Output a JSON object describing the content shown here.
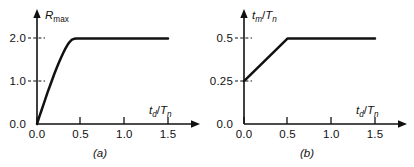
{
  "figure": {
    "background_color": "#ffffff",
    "line_color": "#111111",
    "panels": [
      {
        "key": "a",
        "caption": "(a)",
        "ylabel_main": "R",
        "ylabel_sub": "max",
        "xlabel_main_1": "t",
        "xlabel_sub_1": "d",
        "xlabel_slash": "/",
        "xlabel_main_2": "T",
        "xlabel_sub_2": "n",
        "xticks": [
          "0.0",
          "0.5",
          "1.0",
          "1.5"
        ],
        "yticks": [
          "0.0",
          "1.0",
          "2.0"
        ]
      },
      {
        "key": "b",
        "caption": "(b)",
        "ylabel_main": "t",
        "ylabel_sub": "m",
        "ylabel_slash": "/",
        "ylabel_main_2": "T",
        "ylabel_sub_2": "n",
        "xlabel_main_1": "t",
        "xlabel_sub_1": "d",
        "xlabel_slash": "/",
        "xlabel_main_2": "T",
        "xlabel_sub_2": "n",
        "xticks": [
          "0.0",
          "0.5",
          "1.0",
          "1.5"
        ],
        "yticks": [
          "0.0",
          "0.25",
          "0.5"
        ]
      }
    ]
  },
  "chart_data": [
    {
      "type": "line",
      "title": "(a)",
      "xlabel": "td/Tn",
      "ylabel": "Rmax",
      "xlim": [
        0.0,
        1.6
      ],
      "ylim": [
        0.0,
        2.2
      ],
      "xticks": [
        0.0,
        0.5,
        1.0,
        1.5
      ],
      "yticks": [
        0.0,
        1.0,
        2.0
      ],
      "grid": false,
      "legend": "none",
      "series": [
        {
          "name": "Rmax vs td/Tn",
          "x": [
            0.0,
            0.025,
            0.05,
            0.075,
            0.1,
            0.125,
            0.15,
            0.175,
            0.2,
            0.225,
            0.25,
            0.275,
            0.3,
            0.325,
            0.35,
            0.375,
            0.4,
            0.425,
            0.45,
            0.5,
            0.6,
            0.8,
            1.0,
            1.2,
            1.4,
            1.5
          ],
          "y": [
            0.0,
            0.16,
            0.31,
            0.46,
            0.61,
            0.76,
            0.9,
            1.04,
            1.18,
            1.31,
            1.43,
            1.55,
            1.66,
            1.76,
            1.85,
            1.92,
            1.97,
            1.99,
            2.0,
            2.0,
            2.0,
            2.0,
            2.0,
            2.0,
            2.0,
            2.0
          ]
        }
      ],
      "annotations": [
        "dashed guide at y = 2.0",
        "dashed guide at y = 1.0",
        "curve plateaus at 2.0 for td/Tn >= 0.45"
      ]
    },
    {
      "type": "line",
      "title": "(b)",
      "xlabel": "td/Tn",
      "ylabel": "tm/Tn",
      "xlim": [
        0.0,
        1.6
      ],
      "ylim": [
        0.0,
        0.58
      ],
      "xticks": [
        0.0,
        0.5,
        1.0,
        1.5
      ],
      "yticks": [
        0.0,
        0.25,
        0.5
      ],
      "grid": false,
      "legend": "none",
      "series": [
        {
          "name": "tm/Tn vs td/Tn",
          "x": [
            0.0,
            0.5,
            1.0,
            1.5
          ],
          "y": [
            0.25,
            0.5,
            0.5,
            0.5
          ]
        }
      ],
      "annotations": [
        "dashed guide at y = 0.5",
        "dashed guide at y = 0.25",
        "line rises linearly from 0.25 to 0.5 then stays flat at 0.5"
      ]
    }
  ]
}
